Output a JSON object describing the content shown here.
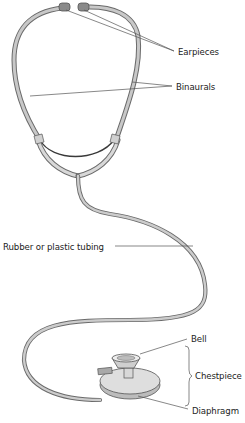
{
  "diagram": {
    "labels": {
      "earpieces": "Earpieces",
      "binaurals": "Binaurals",
      "tubing": "Rubber or plastic tubing",
      "bell": "Bell",
      "chestpiece": "Chestpiece",
      "diaphragm": "Diaphragm"
    },
    "colors": {
      "tube_fill": "#c8c8c8",
      "tube_outline": "#6a6a6a",
      "earpiece_fill": "#8a8a8a",
      "leader_line": "#555555",
      "text": "#222222",
      "background": "#ffffff"
    }
  }
}
